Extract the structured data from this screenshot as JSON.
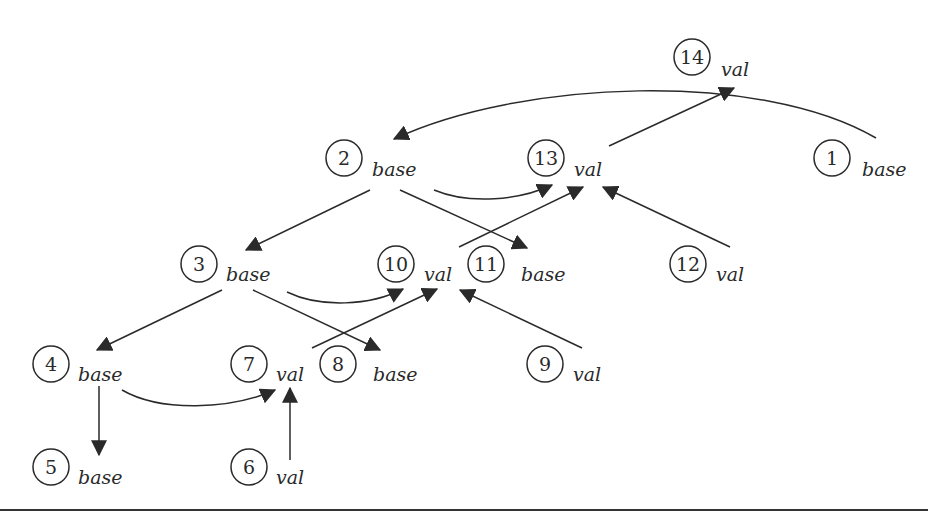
{
  "diagram": {
    "type": "directed-graph",
    "nodes": [
      {
        "id": "1",
        "label": "base",
        "x": 832,
        "y": 156
      },
      {
        "id": "2",
        "label": "base",
        "x": 344,
        "y": 156
      },
      {
        "id": "3",
        "label": "base",
        "x": 199,
        "y": 264
      },
      {
        "id": "4",
        "label": "base",
        "x": 50,
        "y": 364
      },
      {
        "id": "5",
        "label": "base",
        "x": 50,
        "y": 466
      },
      {
        "id": "6",
        "label": "val",
        "x": 248,
        "y": 466
      },
      {
        "id": "7",
        "label": "val",
        "x": 248,
        "y": 364
      },
      {
        "id": "8",
        "label": "base",
        "x": 338,
        "y": 364
      },
      {
        "id": "9",
        "label": "val",
        "x": 544,
        "y": 364
      },
      {
        "id": "10",
        "label": "val",
        "x": 396,
        "y": 264
      },
      {
        "id": "11",
        "label": "base",
        "x": 486,
        "y": 264
      },
      {
        "id": "12",
        "label": "val",
        "x": 688,
        "y": 264
      },
      {
        "id": "13",
        "label": "val",
        "x": 546,
        "y": 156
      },
      {
        "id": "14",
        "label": "val",
        "x": 692,
        "y": 56
      }
    ],
    "edges": [
      {
        "from": "1",
        "to": "2",
        "style": "curved"
      },
      {
        "from": "2",
        "to": "3",
        "style": "straight"
      },
      {
        "from": "2",
        "to": "11",
        "style": "straight"
      },
      {
        "from": "2",
        "to": "13",
        "style": "curved"
      },
      {
        "from": "3",
        "to": "4",
        "style": "straight"
      },
      {
        "from": "3",
        "to": "8",
        "style": "straight"
      },
      {
        "from": "3",
        "to": "10",
        "style": "curved"
      },
      {
        "from": "4",
        "to": "5",
        "style": "straight"
      },
      {
        "from": "4",
        "to": "7",
        "style": "curved"
      },
      {
        "from": "6",
        "to": "7",
        "style": "straight"
      },
      {
        "from": "7",
        "to": "10",
        "style": "straight"
      },
      {
        "from": "9",
        "to": "10",
        "style": "straight"
      },
      {
        "from": "10",
        "to": "13",
        "style": "straight"
      },
      {
        "from": "12",
        "to": "13",
        "style": "straight"
      },
      {
        "from": "13",
        "to": "14",
        "style": "straight"
      }
    ]
  },
  "labels": {
    "n1": "1",
    "n1_tag": "base",
    "n2": "2",
    "n2_tag": "base",
    "n3": "3",
    "n3_tag": "base",
    "n4": "4",
    "n4_tag": "base",
    "n5": "5",
    "n5_tag": "base",
    "n6": "6",
    "n6_tag": "val",
    "n7": "7",
    "n7_tag": "val",
    "n8": "8",
    "n8_tag": "base",
    "n9": "9",
    "n9_tag": "val",
    "n10": "10",
    "n10_tag": "val",
    "n11": "11",
    "n11_tag": "base",
    "n12": "12",
    "n12_tag": "val",
    "n13": "13",
    "n13_tag": "val",
    "n14": "14",
    "n14_tag": "val"
  },
  "colors": {
    "ink": "#2a2a2a",
    "background": "#ffffff"
  }
}
